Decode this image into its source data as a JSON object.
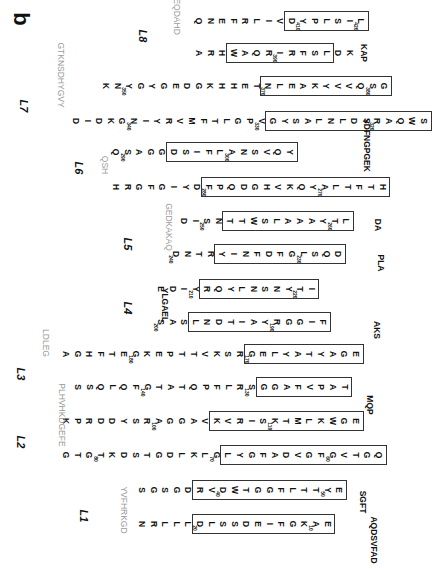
{
  "panel_label": "b",
  "loops": [
    "L1",
    "L2",
    "L3",
    "L4",
    "L5",
    "L6",
    "L7",
    "L8"
  ],
  "rows": [
    {
      "y": 21,
      "x": 193,
      "seq": "QNEFRLIVDYPLSIL",
      "box": [
        8,
        15
      ],
      "nums": {
        "9": "410",
        "14": "420"
      }
    },
    {
      "y": 53,
      "x": 193,
      "seq": "ARHWAQRIRFSLDK",
      "box": [
        3,
        12
      ],
      "nums": {
        "7": "390"
      }
    },
    {
      "y": 86,
      "x": 100,
      "seq": "KNYGYGEDGKHHETNLEAKYVVQSG",
      "box": [
        14,
        25
      ],
      "nums": {
        "2": "350",
        "14": "370",
        "23": "380"
      }
    },
    {
      "y": 121,
      "x": 70,
      "seq": "DIDKGNIYRVMFTLGPVGYSALNLDYRAQWS",
      "box": [
        17,
        31
      ],
      "nums": {
        "5": "340",
        "16": "330",
        "26": "320"
      }
    },
    {
      "y": 152,
      "x": 110,
      "seq": "QSAGGDSIFLANSVQY",
      "box": [
        5,
        16
      ],
      "nums": {
        "1": "290",
        "10": "300"
      }
    },
    {
      "y": 187,
      "x": 110,
      "seq": "HRGFGIYDFPQDGHVKQYALTFTH",
      "box": [
        8,
        24
      ],
      "nums": {
        "8": "280",
        "18": "270"
      }
    },
    {
      "y": 221,
      "x": 178,
      "seq": "DISNTTWSLAAAYTL",
      "box": [
        4,
        15
      ],
      "nums": {
        "2": "250",
        "13": "260"
      }
    },
    {
      "y": 254,
      "x": 170,
      "seq": "DNTRYINFDFGLSQD",
      "box": [
        4,
        15
      ],
      "nums": {
        "0": "240",
        "11": "230"
      }
    },
    {
      "y": 289,
      "x": 155,
      "seq": "EDIYRQYLNSNYTI",
      "box": [
        4,
        14
      ],
      "nums": {
        "3": "210",
        "12": "220"
      }
    },
    {
      "y": 322,
      "x": 155,
      "seq": "SASLNDTIAYRGGIF",
      "box": [
        3,
        15
      ],
      "nums": {
        "0": "200",
        "10": "190"
      }
    },
    {
      "y": 354,
      "x": 60,
      "seq": "AGHFTEGKEPTTVKSRGELYATYAGE",
      "box": [
        16,
        26
      ],
      "nums": {
        "6": "180",
        "16": "170"
      }
    },
    {
      "y": 387,
      "x": 72,
      "seq": "SSQLQFGTATQPFLRSGGAFVPAT",
      "box": [
        16,
        24
      ],
      "nums": {
        "6": "140",
        "15": "130"
      }
    },
    {
      "y": 421,
      "x": 60,
      "seq": "KPRDDYSRAGGAVKVRISKTMLKWGE",
      "box": [
        13,
        26
      ],
      "nums": {
        "8": "100",
        "18": "110"
      }
    },
    {
      "y": 455,
      "x": 60,
      "seq": "GTGTKDSTGDLKLGLYGFADVGFGVTGQ",
      "box": [
        14,
        28
      ],
      "nums": {
        "3": "80",
        "13": "70",
        "23": "60"
      }
    },
    {
      "y": 490,
      "x": 136,
      "seq": "SGSGDRVDWTGGFLTTYE",
      "box": [
        5,
        18
      ],
      "nums": {
        "7": "40",
        "16": "50"
      }
    },
    {
      "y": 524,
      "x": 136,
      "seq": "NRLLLDLSSDEIFGKAE",
      "box": [
        5,
        17
      ],
      "nums": {
        "5": "20",
        "15": "10"
      }
    }
  ],
  "loop_residues": {
    "L1": "YVFHRKGD",
    "L2": "PLHVHKDGEFE",
    "L3": "LDLEG",
    "L4": "YLGAEL",
    "L5": "GEDKAKAQ",
    "L6": "QSH",
    "L7": "GTKNSDHYGVY",
    "L8": "QQEQDAHD"
  },
  "tail": "AQDSVFAD",
  "tail2": "SGFT",
  "tail3": "MQP",
  "tail4": "AKS",
  "tail5": "PLA",
  "tail6": "DA",
  "tail7": "SDFNGPGEK",
  "tail8": "KAP"
}
